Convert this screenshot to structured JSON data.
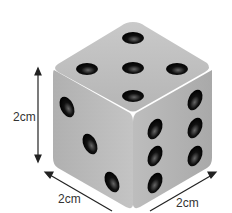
{
  "diagram": {
    "object": "die (cube)",
    "faces_visible": [
      {
        "face": "top",
        "pips": 5
      },
      {
        "face": "left",
        "pips": 3
      },
      {
        "face": "right",
        "pips": 6
      }
    ],
    "dimensions": {
      "height_label": "2cm",
      "depth_label": "2cm",
      "width_label": "2cm"
    },
    "colors": {
      "cube": "#b8b8b8",
      "pip": "#111111",
      "arrow": "#222222"
    }
  }
}
